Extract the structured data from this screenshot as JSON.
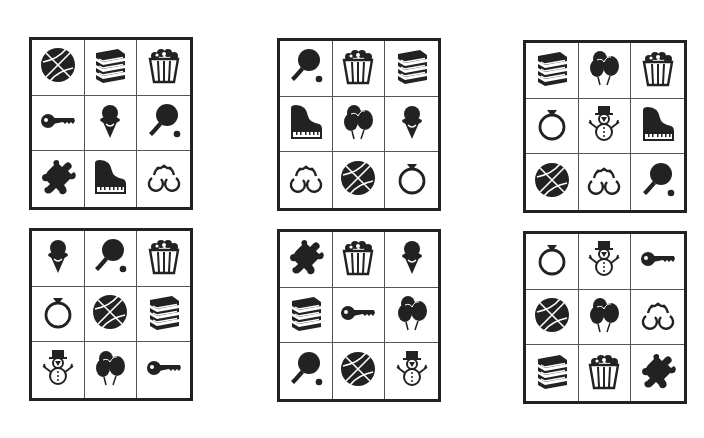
{
  "puzzle": {
    "grids": [
      {
        "id": "grid-1",
        "icons": [
          "basketball",
          "books",
          "popcorn",
          "key",
          "ice-cream",
          "ping-pong",
          "puzzle-piece",
          "piano",
          "handcuffs"
        ]
      },
      {
        "id": "grid-2",
        "icons": [
          "ping-pong",
          "popcorn",
          "books",
          "piano",
          "balloons",
          "ice-cream",
          "handcuffs",
          "basketball",
          "ring"
        ]
      },
      {
        "id": "grid-3",
        "icons": [
          "books",
          "balloons",
          "popcorn",
          "ring",
          "snowman",
          "piano",
          "basketball",
          "handcuffs",
          "ping-pong"
        ]
      },
      {
        "id": "grid-4",
        "icons": [
          "ice-cream",
          "ping-pong",
          "popcorn",
          "ring",
          "basketball",
          "books",
          "snowman",
          "balloons",
          "key"
        ]
      },
      {
        "id": "grid-5",
        "icons": [
          "puzzle-piece",
          "popcorn",
          "ice-cream",
          "books",
          "key",
          "balloons",
          "ping-pong",
          "basketball",
          "snowman"
        ]
      },
      {
        "id": "grid-6",
        "icons": [
          "ring",
          "snowman",
          "key",
          "basketball",
          "balloons",
          "handcuffs",
          "books",
          "popcorn",
          "puzzle-piece"
        ]
      }
    ]
  },
  "colors": {
    "ink": "#222222",
    "background": "#ffffff",
    "grid_line": "#555555"
  }
}
